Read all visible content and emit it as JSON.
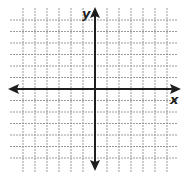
{
  "diagram": {
    "type": "coordinate-plane",
    "x_axis_label": "x",
    "y_axis_label": "y",
    "grid": {
      "lines_left_of_y_axis": 6,
      "lines_right_of_y_axis": 6,
      "lines_above_x_axis": 6,
      "lines_below_x_axis": 6,
      "line_style": "dotted",
      "line_color": "#9a9a9a"
    },
    "axes": {
      "color": "#1e1e1e",
      "arrows": [
        "left",
        "right",
        "up",
        "down"
      ]
    },
    "background": "#ffffff"
  }
}
